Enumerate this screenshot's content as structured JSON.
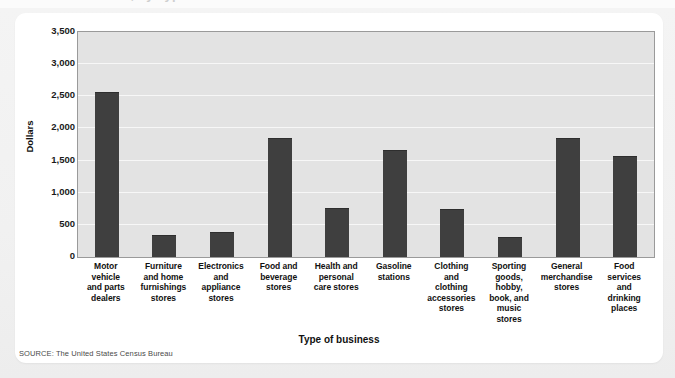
{
  "figure": {
    "source_note": "SOURCE: The United States Census Bureau",
    "cut_off_title": "Retail Sales, by Type of Business",
    "card_background": "#ffffff",
    "plot_background": "#e3e3e3",
    "bar_color": "#3f3f3f"
  },
  "chart_data": {
    "type": "bar",
    "title": "",
    "xlabel": "Type of business",
    "ylabel": "Dollars",
    "ylim": [
      0,
      3500
    ],
    "ytick_values": [
      0,
      500,
      1000,
      1500,
      2000,
      2500,
      3000,
      3500
    ],
    "ytick_labels": [
      "0",
      "500",
      "1,000",
      "1,500",
      "2,000",
      "2,500",
      "3,000",
      "3,500"
    ],
    "grid": true,
    "legend": false,
    "categories": [
      "Motor vehicle and parts dealers",
      "Furniture and home furnishings stores",
      "Electronics and appliance stores",
      "Food and beverage stores",
      "Health and personal care stores",
      "Gasoline stations",
      "Clothing and clothing accessories stores",
      "Sporting goods, hobby, book, and music stores",
      "General merchandise stores",
      "Food services and drinking places"
    ],
    "category_lines": [
      [
        "Motor",
        "vehicle",
        "and parts",
        "dealers"
      ],
      [
        "Furniture",
        "and home",
        "furnishings",
        "stores"
      ],
      [
        "Electronics",
        "and",
        "appliance",
        "stores"
      ],
      [
        "Food and",
        "beverage",
        "stores"
      ],
      [
        "Health and",
        "personal",
        "care stores"
      ],
      [
        "Gasoline",
        "stations"
      ],
      [
        "Clothing",
        "and",
        "clothing",
        "accessories",
        "stores"
      ],
      [
        "Sporting",
        "goods,",
        "hobby,",
        "book, and",
        "music",
        "stores"
      ],
      [
        "General",
        "merchandise",
        "stores"
      ],
      [
        "Food",
        "services",
        "and",
        "drinking",
        "places"
      ]
    ],
    "values": [
      2570,
      345,
      395,
      1855,
      765,
      1665,
      740,
      315,
      1855,
      1565
    ]
  }
}
